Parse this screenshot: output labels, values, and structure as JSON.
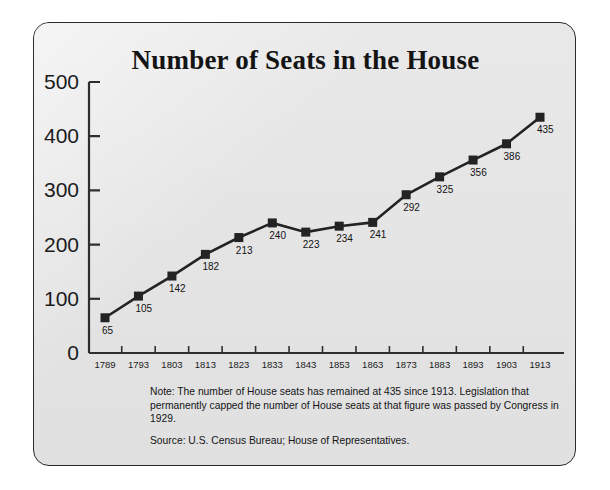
{
  "chart_data": {
    "type": "line",
    "title": "Number of Seats in the House",
    "xlabel": "",
    "ylabel": "",
    "categories": [
      "1789",
      "1793",
      "1803",
      "1813",
      "1823",
      "1833",
      "1843",
      "1853",
      "1863",
      "1873",
      "1883",
      "1893",
      "1903",
      "1913"
    ],
    "values": [
      65,
      105,
      142,
      182,
      213,
      240,
      223,
      234,
      241,
      292,
      325,
      356,
      386,
      435
    ],
    "point_labels": [
      "65",
      "105",
      "142",
      "182",
      "213",
      "240",
      "223",
      "234",
      "241",
      "292",
      "325",
      "356",
      "386",
      "435"
    ],
    "ylim": [
      0,
      500
    ],
    "yticks": [
      0,
      100,
      200,
      300,
      400,
      500
    ],
    "ytick_labels": [
      "0",
      "100",
      "200",
      "300",
      "400",
      "500"
    ],
    "grid": false,
    "legend": null,
    "marker": "square",
    "series_color": "#232323"
  },
  "footnotes": {
    "note": "Note: The number of House seats has remained at 435 since 1913. Legislation that permanently capped the number of House seats at that figure was passed by Congress in 1929.",
    "source": "Source: U.S. Census Bureau; House of Representatives."
  },
  "colors": {
    "panel_background": "#ececed",
    "panel_border": "#2b2b2b",
    "line": "#232323",
    "text": "#141414",
    "page_background": "#ffffff"
  }
}
